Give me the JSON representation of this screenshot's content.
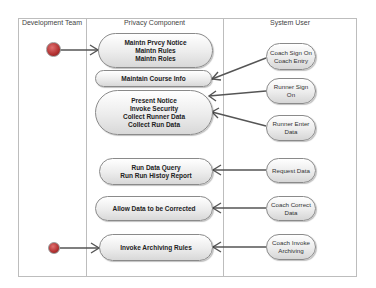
{
  "diagram": {
    "lanes": [
      {
        "id": "development-team",
        "title": "Development Team"
      },
      {
        "id": "privacy-component",
        "title": "Privacy Component"
      },
      {
        "id": "system-user",
        "title": "System User"
      }
    ],
    "states": [
      {
        "id": "s1",
        "lines": [
          "Maintn Prvcy Notice",
          "Maintn Rules",
          "Maintn Roles"
        ]
      },
      {
        "id": "s2",
        "lines": [
          "Maintain Course Info"
        ]
      },
      {
        "id": "s3",
        "lines": [
          "Present Notice",
          "Invoke Security",
          "Collect  Runner Data",
          "Collect Run Data"
        ]
      },
      {
        "id": "s4",
        "lines": [
          "Run Data Query",
          "Run Run Histoy Report"
        ]
      },
      {
        "id": "s5",
        "lines": [
          "Allow Data to be Corrected"
        ]
      },
      {
        "id": "s6",
        "lines": [
          "Invoke Archiving Rules"
        ]
      }
    ],
    "actors": [
      {
        "id": "a1",
        "lines": [
          "Coach Sign On",
          "Coach Entry"
        ]
      },
      {
        "id": "a2",
        "lines": [
          "Runner Sign",
          "On"
        ]
      },
      {
        "id": "a3",
        "lines": [
          "Runner Enter",
          "Data"
        ]
      },
      {
        "id": "a4",
        "lines": [
          "Request Data"
        ]
      },
      {
        "id": "a5",
        "lines": [
          "Coach Correct",
          "Data"
        ]
      },
      {
        "id": "a6",
        "lines": [
          "Coach Invoke",
          "Archiving"
        ]
      }
    ],
    "transitions": [
      {
        "from": "initial-1",
        "to": "s1"
      },
      {
        "from": "initial-2",
        "to": "s6"
      },
      {
        "from": "a1",
        "to": "s2"
      },
      {
        "from": "a2",
        "to": "s3"
      },
      {
        "from": "a3",
        "to": "s3"
      },
      {
        "from": "a4",
        "to": "s4"
      },
      {
        "from": "a5",
        "to": "s5"
      },
      {
        "from": "a6",
        "to": "s6"
      }
    ],
    "colors": {
      "initial_node": "#b23030",
      "line": "#555555",
      "border": "#bdbdbd"
    }
  }
}
